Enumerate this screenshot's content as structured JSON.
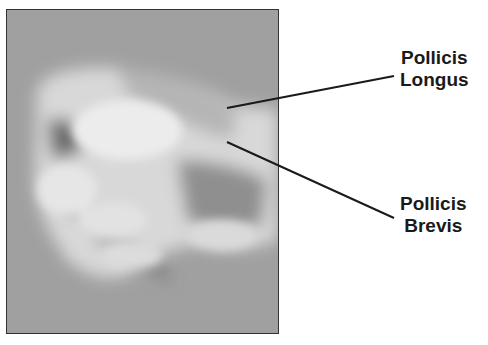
{
  "figure": {
    "photo_alt": "Clenched fist showing thumb extensor tendons at the wrist",
    "labels": [
      {
        "line1": "Pollicis",
        "line2": "Longus"
      },
      {
        "line1": "Pollicis",
        "line2": "Brevis"
      }
    ]
  }
}
